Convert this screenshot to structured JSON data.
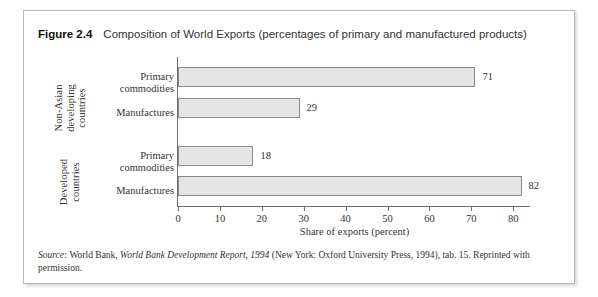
{
  "figure": {
    "label": "Figure 2.4",
    "caption": "Composition of World Exports (percentages of primary and manufactured products)",
    "source_prefix": "Source:",
    "source_text_1": " World Bank, ",
    "source_italic": "World Bank Development Report, 1994",
    "source_text_2": " (New York: Oxford University Press, 1994), tab. 15. Reprinted with permission."
  },
  "chart_data": {
    "type": "bar",
    "orientation": "horizontal",
    "title": "Composition of World Exports (percentages of primary and manufactured products)",
    "xlabel": "Share of exports (percent)",
    "ylabel": "",
    "xlim": [
      0,
      84
    ],
    "xticks": [
      0,
      10,
      20,
      30,
      40,
      50,
      60,
      70,
      80
    ],
    "xticklabels": [
      "0",
      "10",
      "20",
      "30",
      "40",
      "50",
      "60",
      "70",
      "80"
    ],
    "grid": false,
    "legend": false,
    "groups": [
      {
        "name": "Non-Asian developing countries",
        "name_lines": [
          "Non-Asian",
          "developing",
          "countries"
        ]
      },
      {
        "name": "Developed countries",
        "name_lines": [
          "Developed",
          "countries"
        ]
      }
    ],
    "categories": [
      "Primary commodities",
      "Manufactures",
      "Primary commodities",
      "Manufactures"
    ],
    "category_lines": [
      [
        "Primary",
        "commodities"
      ],
      [
        "Manufactures"
      ],
      [
        "Primary",
        "commodities"
      ],
      [
        "Manufactures"
      ]
    ],
    "values": [
      71,
      29,
      18,
      82
    ],
    "value_labels": [
      "71",
      "29",
      "18",
      "82"
    ],
    "bar_fill_color": "#e4e4e4",
    "bar_border_color": "#8a8a8a",
    "series": [
      {
        "name": "Share of exports (percent)",
        "values": [
          71,
          29,
          18,
          82
        ]
      }
    ]
  }
}
